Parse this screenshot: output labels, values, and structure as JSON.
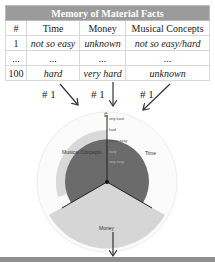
{
  "table": {
    "title": "Memory of Material Facts",
    "columns": [
      "#",
      "Time",
      "Money",
      "Musical Concepts"
    ],
    "rows": [
      [
        "1",
        "not so easy",
        "unknown",
        "not so easy/hard"
      ],
      [
        "...",
        "...",
        "...",
        "..."
      ],
      [
        "100",
        "hard",
        "very hard",
        "unknown"
      ]
    ]
  },
  "arrows": {
    "top": [
      "# 1",
      "# 1",
      "# 1"
    ],
    "bottom": "# 1"
  },
  "radial": {
    "axis_symbol": "Ē",
    "scale_labels": [
      "very hard",
      "hard",
      "not so easy",
      "easy",
      "very easy"
    ],
    "sectors": [
      "Musical Concepts",
      "Time",
      "Money"
    ],
    "colors": {
      "outer_ring": "#f2f2f2",
      "light_sector": "#d6d6d6",
      "dark_core": "#6b6b6b",
      "header_bg": "#9b9b9b"
    }
  }
}
